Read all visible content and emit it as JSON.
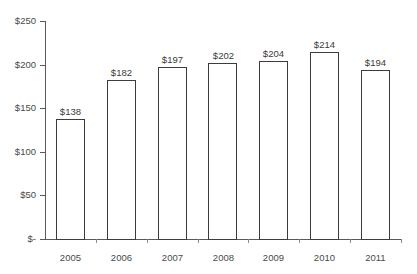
{
  "chart_data": {
    "type": "bar",
    "title": "",
    "subtitle": "",
    "xlabel": "",
    "ylabel": "",
    "categories": [
      "2005",
      "2006",
      "2007",
      "2008",
      "2009",
      "2010",
      "2011"
    ],
    "values": [
      138,
      182,
      197,
      202,
      204,
      214,
      194
    ],
    "data_labels": [
      "$138",
      "$182",
      "$197",
      "$202",
      "$204",
      "$214",
      "$194"
    ],
    "ylim": [
      0,
      250
    ],
    "y_ticks": [
      0,
      50,
      100,
      150,
      200,
      250
    ],
    "y_tick_labels": [
      "$-",
      "$50",
      "$100",
      "$150",
      "$200",
      "$250"
    ],
    "grid": false,
    "legend": false,
    "legend_position": "none",
    "bar_fill_color": "#ffffff",
    "bar_border_color": "#3c3c3c",
    "axis_color": "#595959",
    "text_color": "#4a4a4a",
    "background_color": "#ffffff"
  }
}
